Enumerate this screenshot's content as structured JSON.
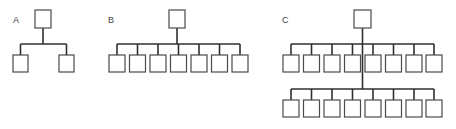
{
  "colors": {
    "box_stroke": "#4a4a4a",
    "line": "#2f2f2f",
    "label": "#444444",
    "background": "#ffffff"
  },
  "diagrams": [
    {
      "label": "A",
      "label_pos": [
        13,
        23
      ],
      "root": {
        "x": 35,
        "y": 10,
        "w": 16,
        "h": 18
      },
      "rows": [
        {
          "bar_y": 44,
          "box_y": 55,
          "box_w": 15,
          "box_h": 17,
          "box_x": [
            13,
            59
          ]
        }
      ]
    },
    {
      "label": "B",
      "label_pos": [
        108,
        23
      ],
      "root": {
        "x": 169,
        "y": 10,
        "w": 16,
        "h": 18
      },
      "rows": [
        {
          "bar_y": 44,
          "box_y": 55,
          "box_w": 16,
          "box_h": 17,
          "box_x": [
            109,
            129.5,
            150,
            170.5,
            191,
            211.5,
            232
          ]
        }
      ]
    },
    {
      "label": "C",
      "label_pos": [
        282,
        23
      ],
      "root": {
        "x": 354,
        "y": 10,
        "w": 17,
        "h": 18
      },
      "rows": [
        {
          "bar_y": 44,
          "box_y": 55,
          "box_w": 16,
          "box_h": 17,
          "box_x": [
            283,
            303.5,
            324,
            344.5,
            365,
            385.5,
            406,
            426
          ]
        },
        {
          "bar_y": 89,
          "box_y": 100,
          "box_w": 16,
          "box_h": 17,
          "box_x": [
            283,
            303.5,
            324,
            344.5,
            365,
            385.5,
            406,
            426
          ]
        }
      ]
    }
  ]
}
